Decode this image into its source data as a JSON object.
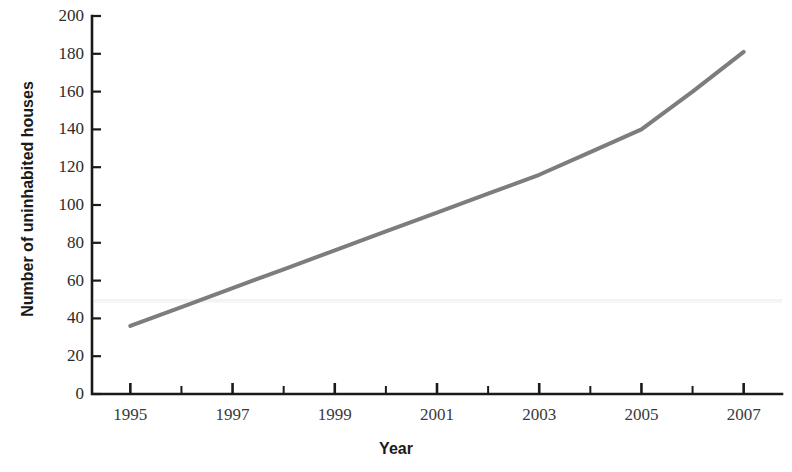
{
  "figure": {
    "clipped_caption": "",
    "background_color": "#ffffff"
  },
  "chart_data": {
    "type": "line",
    "title": "",
    "xlabel": "Year",
    "ylabel": "Number of uninhabited houses",
    "x": [
      1995,
      1996,
      1997,
      1998,
      1999,
      2000,
      2001,
      2002,
      2003,
      2004,
      2005,
      2006,
      2007
    ],
    "values": [
      36,
      46,
      56,
      66,
      76,
      86,
      96,
      106,
      116,
      128,
      140,
      160,
      181
    ],
    "series": [
      {
        "name": "Uninhabited houses",
        "color": "#7d7d7d",
        "values": [
          36,
          46,
          56,
          66,
          76,
          86,
          96,
          106,
          116,
          128,
          140,
          160,
          181
        ]
      }
    ],
    "xlim": [
      1994.25,
      2007.75
    ],
    "ylim": [
      0,
      200
    ],
    "ytick_labels": [
      "0",
      "20",
      "40",
      "60",
      "80",
      "100",
      "120",
      "140",
      "160",
      "180",
      "200"
    ],
    "ytick_values": [
      0,
      20,
      40,
      60,
      80,
      100,
      120,
      140,
      160,
      180,
      200
    ],
    "xtick_labels": [
      "1995",
      "1997",
      "1999",
      "2001",
      "2003",
      "2005",
      "2007"
    ],
    "xtick_values": [
      1995,
      1997,
      1999,
      2001,
      2003,
      2005,
      2007
    ],
    "x_minor_ticks": [
      1996,
      1998,
      2000,
      2002,
      2004,
      2006
    ],
    "grid": false,
    "legend": false,
    "line_color": "#7d7d7d",
    "line_width": 4,
    "axis_color": "#1a1a1a"
  }
}
